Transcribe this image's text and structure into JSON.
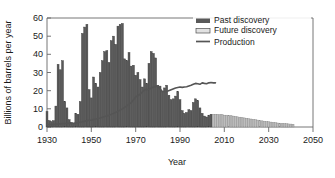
{
  "chart_data": {
    "type": "bar",
    "title": "",
    "xlabel": "Year",
    "ylabel": "Billions of barrels per year",
    "xlim": [
      1930,
      2050
    ],
    "ylim": [
      0,
      60
    ],
    "xticks": [
      1930,
      1950,
      1970,
      1990,
      2010,
      2030,
      2050
    ],
    "yticks": [
      0,
      10,
      20,
      30,
      40,
      50,
      60
    ],
    "grid": false,
    "legend_position": "top-right",
    "legend": [
      "Past discovery",
      "Future discovery",
      "Production"
    ],
    "colors": {
      "past_discovery": "#595959",
      "future_discovery": "#bdbdbd",
      "production": "#555555",
      "axis": "#555555",
      "background": "#ffffff"
    },
    "series": [
      {
        "name": "Past discovery",
        "type": "bar",
        "x": [
          1930,
          1931,
          1932,
          1933,
          1934,
          1935,
          1936,
          1937,
          1938,
          1939,
          1940,
          1941,
          1942,
          1943,
          1944,
          1945,
          1946,
          1947,
          1948,
          1949,
          1950,
          1951,
          1952,
          1953,
          1954,
          1955,
          1956,
          1957,
          1958,
          1959,
          1960,
          1961,
          1962,
          1963,
          1964,
          1965,
          1966,
          1967,
          1968,
          1969,
          1970,
          1971,
          1972,
          1973,
          1974,
          1975,
          1976,
          1977,
          1978,
          1979,
          1980,
          1981,
          1982,
          1983,
          1984,
          1985,
          1986,
          1987,
          1988,
          1989,
          1990,
          1991,
          1992,
          1993,
          1994,
          1995,
          1996,
          1997,
          1998,
          1999,
          2000,
          2001,
          2002,
          2003,
          2004
        ],
        "values": [
          8.5,
          3.5,
          3.0,
          3.5,
          11.5,
          34.5,
          31.5,
          36.5,
          14.0,
          10.5,
          4.0,
          2.5,
          2.0,
          7.5,
          7.0,
          14.0,
          51.5,
          55.0,
          56.5,
          20.5,
          16.0,
          27.5,
          24.0,
          22.0,
          30.0,
          36.5,
          41.5,
          42.0,
          35.5,
          47.5,
          50.0,
          45.5,
          55.5,
          56.5,
          57.0,
          37.5,
          36.5,
          41.0,
          33.5,
          34.0,
          28.5,
          30.0,
          26.0,
          22.0,
          26.5,
          24.0,
          35.0,
          41.5,
          40.5,
          38.0,
          23.0,
          22.5,
          19.5,
          21.5,
          23.0,
          17.5,
          15.0,
          15.5,
          17.0,
          19.5,
          15.0,
          9.0,
          7.5,
          8.0,
          9.5,
          9.0,
          13.5,
          15.5,
          14.5,
          10.5,
          7.5,
          6.0,
          5.5,
          6.5,
          7.0
        ]
      },
      {
        "name": "Future discovery",
        "type": "bar",
        "x": [
          2005,
          2006,
          2007,
          2008,
          2009,
          2010,
          2011,
          2012,
          2013,
          2014,
          2015,
          2016,
          2017,
          2018,
          2019,
          2020,
          2021,
          2022,
          2023,
          2024,
          2025,
          2026,
          2027,
          2028,
          2029,
          2030,
          2031,
          2032,
          2033,
          2034,
          2035,
          2036,
          2037,
          2038,
          2039,
          2040,
          2041
        ],
        "values": [
          7.0,
          7.0,
          7.0,
          6.8,
          6.8,
          6.5,
          6.5,
          6.3,
          6.2,
          6.0,
          5.8,
          5.6,
          5.4,
          5.2,
          5.0,
          4.8,
          4.6,
          4.4,
          4.2,
          4.0,
          3.8,
          3.6,
          3.4,
          3.2,
          3.0,
          2.9,
          2.7,
          2.5,
          2.4,
          2.2,
          2.1,
          2.0,
          1.9,
          1.8,
          1.7,
          1.6,
          1.5
        ]
      },
      {
        "name": "Production",
        "type": "line",
        "x": [
          1930,
          1932,
          1934,
          1936,
          1938,
          1940,
          1942,
          1944,
          1946,
          1948,
          1950,
          1952,
          1954,
          1956,
          1958,
          1960,
          1962,
          1964,
          1966,
          1968,
          1970,
          1972,
          1974,
          1976,
          1978,
          1980,
          1982,
          1984,
          1986,
          1988,
          1990,
          1991,
          1992,
          1993,
          1994,
          1995,
          1996,
          1997,
          1998,
          1999,
          2000,
          2001,
          2002,
          2003,
          2004,
          2005,
          2006
        ],
        "values": [
          1.4,
          1.3,
          1.5,
          1.7,
          1.9,
          2.1,
          2.0,
          2.4,
          2.9,
          3.5,
          3.9,
          4.4,
          5.0,
          5.8,
          6.4,
          7.5,
          8.6,
          10.0,
          11.6,
          13.4,
          16.5,
          18.0,
          20.5,
          20.8,
          22.0,
          22.5,
          19.5,
          19.5,
          20.5,
          21.5,
          22.0,
          21.8,
          22.0,
          22.2,
          22.6,
          23.0,
          23.5,
          24.0,
          23.8,
          23.5,
          24.3,
          24.0,
          23.8,
          24.3,
          24.5,
          24.3,
          24.3
        ]
      }
    ]
  },
  "axis": {
    "ylabel": "Billions of barrels per year",
    "xlabel": "Year",
    "yticks": [
      "60",
      "50",
      "40",
      "30",
      "20",
      "10",
      "0"
    ],
    "xticks": [
      "1930",
      "1950",
      "1970",
      "1990",
      "2010",
      "2030",
      "2050"
    ]
  },
  "legend": {
    "items": [
      {
        "label": "Past discovery",
        "swatch": "filled-dark-swatch"
      },
      {
        "label": "Future discovery",
        "swatch": "filled-light-swatch"
      },
      {
        "label": "Production",
        "swatch": "line-swatch"
      }
    ]
  }
}
